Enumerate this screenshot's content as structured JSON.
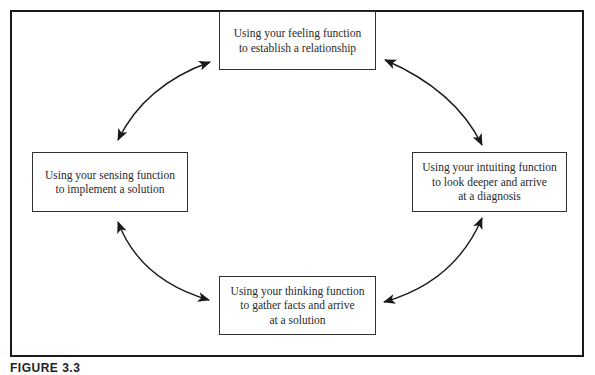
{
  "diagram": {
    "type": "cycle",
    "nodes": [
      {
        "id": "top",
        "lines": [
          "Using your feeling function",
          "to establish a relationship"
        ]
      },
      {
        "id": "right",
        "lines": [
          "Using your intuiting function",
          "to look deeper and arrive",
          "at a diagnosis"
        ]
      },
      {
        "id": "bottom",
        "lines": [
          "Using your thinking function",
          "to gather facts and arrive",
          "at a solution"
        ]
      },
      {
        "id": "left",
        "lines": [
          "Using your sensing function",
          "to implement a solution"
        ]
      }
    ],
    "edges": [
      {
        "from": "top",
        "to": "right",
        "style": "bidirectional-arrow"
      },
      {
        "from": "right",
        "to": "bottom",
        "style": "bidirectional-arrow"
      },
      {
        "from": "bottom",
        "to": "left",
        "style": "bidirectional-arrow"
      },
      {
        "from": "left",
        "to": "top",
        "style": "bidirectional-arrow"
      }
    ],
    "caption": "FIGURE 3.3"
  },
  "colors": {
    "stroke": "#1a1a1a",
    "text": "#2a2a2a",
    "background": "#ffffff"
  }
}
